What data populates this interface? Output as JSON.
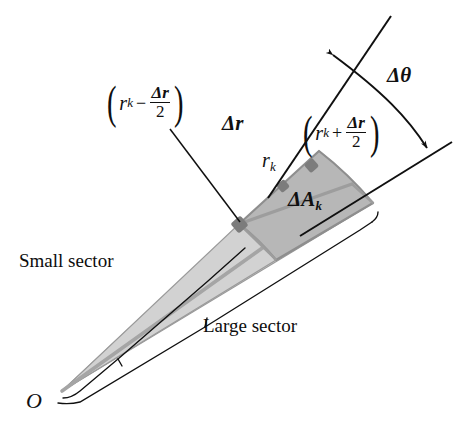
{
  "figure": {
    "background_color": "#ffffff",
    "ink_color": "#101010",
    "light_sector_fill": "#dcdcdc",
    "dark_region_fill": "#b7b7b7",
    "outline_color": "#8f8f8f",
    "dot_color": "#7a7a7a"
  },
  "labels": {
    "origin": "O",
    "small_sector": "Small sector",
    "large_sector": "Large sector",
    "delta_r": "Δr",
    "delta_theta": "Δθ",
    "r_k": "r",
    "r_k_sub": "k",
    "delta_area": "ΔA",
    "delta_area_sub": "k",
    "inner_radius": {
      "open_paren": "(",
      "var": "r",
      "sub": "k",
      "operator": "−",
      "numerator": "Δr",
      "denominator": "2",
      "close_paren": ")",
      "plain": "(r_k − Δr/2)"
    },
    "outer_radius": {
      "open_paren": "(",
      "var": "r",
      "sub": "k",
      "operator": "+",
      "numerator": "Δr",
      "denominator": "2",
      "close_paren": ")",
      "plain": "(r_k + Δr/2)"
    }
  },
  "geometry": {
    "origin_point": [
      62,
      391
    ],
    "small_sector_radius": 300,
    "large_sector_radius": 352,
    "angle_upper_deg": -43.0,
    "angle_lower_deg": -28.0,
    "midline_angle_deg": -35.5,
    "inner_arc_radius": 243,
    "outer_arc_radius": 352
  },
  "icons": {
    "arrow_head": "arrowhead",
    "leader_line": "leader-line",
    "bracket": "sector-bracket"
  }
}
